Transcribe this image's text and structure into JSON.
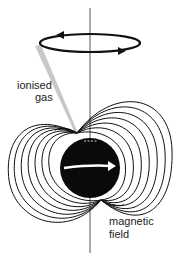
{
  "labels": {
    "gas_line1": "ionised",
    "gas_line2": "gas",
    "field_line1": "magnetic",
    "field_line2": "field"
  },
  "colors": {
    "ink": "#111111",
    "cone": "#c8c8c8",
    "background": "#ffffff"
  }
}
